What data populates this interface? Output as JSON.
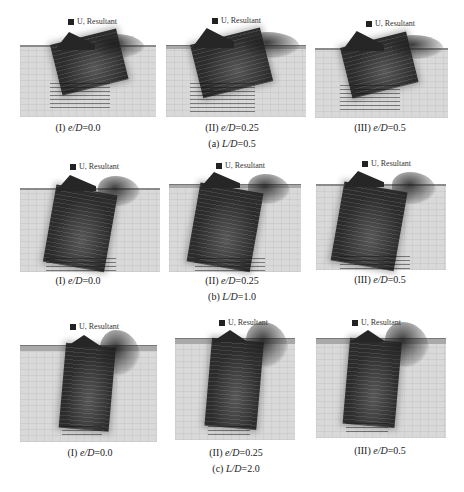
{
  "legend_text": "U, Resultant",
  "rows": [
    {
      "group_caption": "(a) L/D=0.5",
      "group_prefix": "(a) ",
      "group_var": "L/D",
      "group_value": "=0.5",
      "panels": [
        {
          "roman": "(I) ",
          "var": "e/D",
          "value": "=0.0"
        },
        {
          "roman": "(II) ",
          "var": "e/D",
          "value": "=0.25"
        },
        {
          "roman": "(III) ",
          "var": "e/D",
          "value": "=0.5"
        }
      ]
    },
    {
      "group_caption": "(b) L/D=1.0",
      "group_prefix": "(b) ",
      "group_var": "L/D",
      "group_value": "=1.0",
      "panels": [
        {
          "roman": "(I) ",
          "var": "e/D",
          "value": "=0.0"
        },
        {
          "roman": "(II) ",
          "var": "e/D",
          "value": "=0.25"
        },
        {
          "roman": "(III) ",
          "var": "e/D",
          "value": "=0.5"
        }
      ]
    },
    {
      "group_caption": "(c) L/D=2.0",
      "group_prefix": "(c) ",
      "group_var": "L/D",
      "group_value": "=2.0",
      "panels": [
        {
          "roman": "(I) ",
          "var": "e/D",
          "value": "=0.0"
        },
        {
          "roman": "(II) ",
          "var": "e/D",
          "value": "=0.25"
        },
        {
          "roman": "(III) ",
          "var": "e/D",
          "value": "=0.5"
        }
      ]
    }
  ]
}
